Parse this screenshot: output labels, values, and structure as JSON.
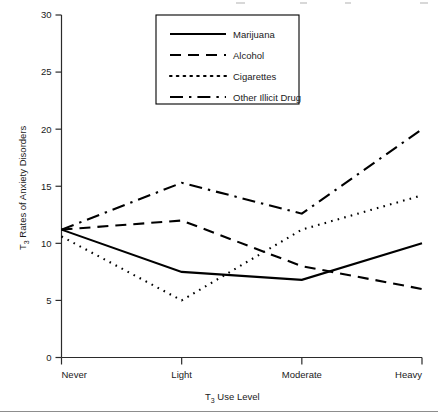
{
  "chart_data": {
    "type": "line",
    "title": "",
    "xlabel": "T3 Use Level",
    "xlabel_main": "T",
    "xlabel_sub": "3",
    "xlabel_rest": " Use Level",
    "ylabel": "T3 Rates of Anxiety Disorders",
    "ylabel_main": "T",
    "ylabel_sub": "3",
    "ylabel_rest": " Rates of Anxiety Disorders",
    "categories": [
      "Never",
      "Light",
      "Moderate",
      "Heavy"
    ],
    "ylim": [
      0,
      30
    ],
    "yticks": [
      0,
      5,
      10,
      15,
      20,
      25,
      30
    ],
    "ytick_labels": [
      "0",
      "5",
      "10",
      "15",
      "20",
      "25",
      "30"
    ],
    "grid": false,
    "legend_position": "top-center",
    "series": [
      {
        "name": "Marijuana",
        "dash": "solid",
        "values": [
          11.2,
          7.5,
          6.8,
          10.0
        ]
      },
      {
        "name": "Alcohol",
        "dash": "dashed",
        "values": [
          11.2,
          12.0,
          8.0,
          6.0
        ]
      },
      {
        "name": "Cigarettes",
        "dash": "dotted",
        "values": [
          10.6,
          5.0,
          11.2,
          14.2
        ]
      },
      {
        "name": "Other Illicit Drug",
        "dash": "dashdot",
        "values": [
          11.2,
          15.3,
          12.6,
          20.0
        ]
      }
    ]
  },
  "legend": {
    "items": [
      {
        "label": "Marijuana"
      },
      {
        "label": "Alcohol"
      },
      {
        "label": "Cigarettes"
      },
      {
        "label": "Other Illicit Drug"
      }
    ]
  }
}
